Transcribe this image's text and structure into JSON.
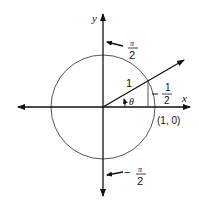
{
  "diagram": {
    "type": "unit-circle",
    "labels": {
      "y_axis": "y",
      "x_axis": "x",
      "top_numer": "π",
      "top_denom": "2",
      "bottom_sign": "−",
      "bottom_numer": "π",
      "bottom_denom": "2",
      "radius": "1",
      "angle": "θ",
      "height_numer": "1",
      "height_denom": "2",
      "point": "(1, 0)"
    },
    "colors": {
      "stroke": "#111111",
      "circle": "#555555",
      "background": "#ffffff"
    }
  }
}
